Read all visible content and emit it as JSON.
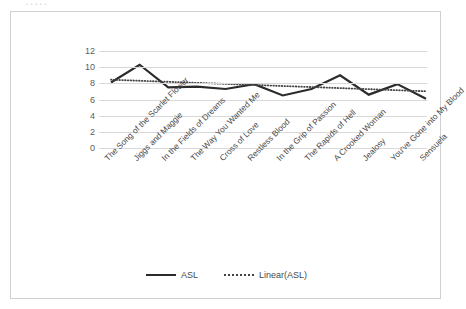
{
  "top_strip": {
    "clipped_text": "•           •      •         •              •"
  },
  "legend": {
    "position": "bottom-center",
    "items": [
      {
        "label": "ASL",
        "style": "solid",
        "color": "#2b2b2b"
      },
      {
        "label": "Linear(ASL)",
        "style": "dotted",
        "color": "#444444"
      }
    ]
  },
  "chart_data": {
    "type": "line",
    "title": "",
    "xlabel": "",
    "ylabel": "",
    "ylim": [
      0,
      12
    ],
    "yticks": [
      0,
      2,
      4,
      6,
      8,
      10,
      12
    ],
    "grid": true,
    "legend_position": "bottom-center",
    "categories": [
      "The Song of the Scarlet Flower",
      "Jiggs and Maggie",
      "In the Fields of Dreams",
      "The Way You Wanted Me",
      "Cross of Love",
      "Restless Blood",
      "In the Grip of Passion",
      "The Rapids of Hell",
      "A Crooked Woman",
      "Jealosy",
      "You've Gone into My Blood",
      "Sensuela"
    ],
    "series": [
      {
        "name": "ASL",
        "style": "solid",
        "color": "#2b2b2b",
        "values": [
          8.1,
          10.3,
          7.5,
          7.6,
          7.3,
          7.9,
          6.5,
          7.3,
          9.0,
          6.6,
          7.9,
          6.1
        ]
      },
      {
        "name": "Linear(ASL)",
        "style": "dotted",
        "color": "#444444",
        "trendline": true,
        "values": [
          8.45,
          8.32,
          8.19,
          8.06,
          7.93,
          7.8,
          7.67,
          7.54,
          7.41,
          7.28,
          7.15,
          7.02
        ]
      }
    ]
  }
}
